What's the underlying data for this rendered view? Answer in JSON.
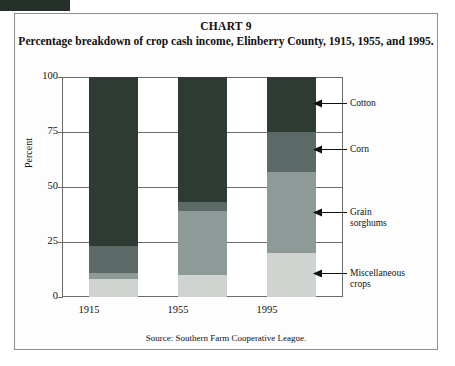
{
  "figure": {
    "chart_number": "CHART 9",
    "title": "Percentage breakdown of crop cash income, Elinberry County, 1915, 1955, and 1995.",
    "source": "Source: Southern Farm Cooperative League."
  },
  "axes": {
    "ylabel": "Percent",
    "yticks": [
      "100",
      "75",
      "50",
      "25",
      "0"
    ],
    "xticks": [
      "1915",
      "1955",
      "1995"
    ]
  },
  "callouts": [
    {
      "label": "Cotton"
    },
    {
      "label": "Corn"
    },
    {
      "label": "Grain\nsorghums"
    },
    {
      "label": "Miscellaneous\ncrops"
    }
  ],
  "colors": {
    "cotton": "#2d3b33",
    "corn": "#5b6a66",
    "grain_sorghums": "#8e9a97",
    "miscellaneous_crops": "#cfd4d1",
    "axis": "#6a6c6a",
    "text": "#111111",
    "frame": "#8d8f8d"
  },
  "chart_data": {
    "type": "bar",
    "stacked": true,
    "title": "Percentage breakdown of crop cash income, Elinberry County, 1915, 1955, and 1995.",
    "xlabel": "",
    "ylabel": "Percent",
    "ylim": [
      0,
      100
    ],
    "yticks": [
      0,
      25,
      50,
      75,
      100
    ],
    "grid": true,
    "legend_position": "right-callouts",
    "categories": [
      "1915",
      "1955",
      "1995"
    ],
    "series": [
      {
        "name": "Miscellaneous crops",
        "color": "#cfd4d1",
        "values": [
          8,
          10,
          20
        ]
      },
      {
        "name": "Grain sorghums",
        "color": "#8e9a97",
        "values": [
          3,
          29,
          37
        ]
      },
      {
        "name": "Corn",
        "color": "#5b6a66",
        "values": [
          12,
          4,
          18
        ]
      },
      {
        "name": "Cotton",
        "color": "#2d3b33",
        "values": [
          77,
          57,
          25
        ]
      }
    ]
  }
}
